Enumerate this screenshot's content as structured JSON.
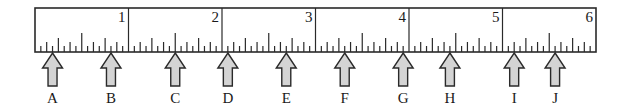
{
  "ruler": {
    "units": "inches",
    "subdivisions_per_inch": 16,
    "inch_labels": [
      "1",
      "2",
      "3",
      "4",
      "5",
      "6"
    ],
    "start_value": 0,
    "end_value": 6
  },
  "arrows": [
    {
      "label": "A",
      "position_sixteenths": 3
    },
    {
      "label": "B",
      "position_sixteenths": 13
    },
    {
      "label": "C",
      "position_sixteenths": 24
    },
    {
      "label": "D",
      "position_sixteenths": 33
    },
    {
      "label": "E",
      "position_sixteenths": 43
    },
    {
      "label": "F",
      "position_sixteenths": 53
    },
    {
      "label": "G",
      "position_sixteenths": 63
    },
    {
      "label": "H",
      "position_sixteenths": 71
    },
    {
      "label": "I",
      "position_sixteenths": 82
    },
    {
      "label": "J",
      "position_sixteenths": 89
    }
  ],
  "colors": {
    "line": "#2a2a2a",
    "arrow_fill": "#d4d4d4",
    "arrow_stroke": "#2a2a2a"
  }
}
